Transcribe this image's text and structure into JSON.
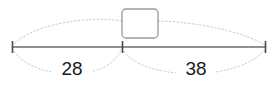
{
  "diagram": {
    "type": "number-line-bar-model",
    "background_color": "#ffffff",
    "line_color": "#6b6b6b",
    "dotted_color": "#c9c9c9",
    "box_border_color": "#9a9a9a",
    "text_color": "#1a1a1a",
    "answer_box": {
      "value": "",
      "placeholder": ""
    },
    "segments": [
      {
        "id": "left",
        "label": "28"
      },
      {
        "id": "right",
        "label": "38"
      }
    ],
    "ticks": [
      {
        "id": "left-end"
      },
      {
        "id": "center"
      },
      {
        "id": "right-end"
      }
    ]
  }
}
